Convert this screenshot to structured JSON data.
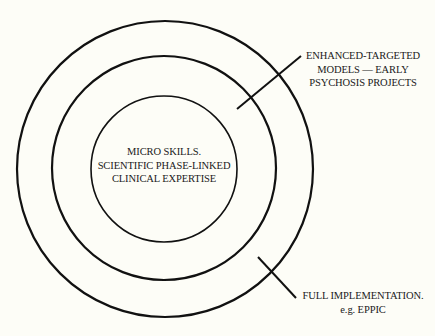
{
  "diagram": {
    "type": "concentric-circles",
    "background": "#fdfdf7",
    "stroke_color": "#111111",
    "rings": [
      {
        "name": "outer",
        "cx": 165,
        "cy": 169,
        "r": 148
      },
      {
        "name": "middle",
        "cx": 164,
        "cy": 168,
        "r": 112
      },
      {
        "name": "inner",
        "cx": 164,
        "cy": 169,
        "r": 73
      }
    ],
    "leaders": [
      {
        "name": "enhanced-leader",
        "x1": 237,
        "y1": 109,
        "x2": 301,
        "y2": 56
      },
      {
        "name": "full-leader",
        "x1": 258,
        "y1": 257,
        "x2": 296,
        "y2": 298
      }
    ],
    "labels": {
      "center": {
        "lines": [
          "MICRO SKILLS.",
          "SCIENTIFIC PHASE-LINKED",
          "CLINICAL EXPERTISE"
        ]
      },
      "enhanced": {
        "lines": [
          "ENHANCED-TARGETED",
          "MODELS — EARLY",
          "PSYCHOSIS PROJECTS"
        ]
      },
      "full": {
        "lines": [
          "FULL IMPLEMENTATION.",
          "e.g. EPPIC"
        ]
      }
    }
  }
}
